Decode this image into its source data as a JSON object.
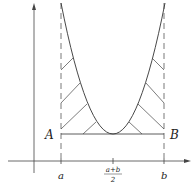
{
  "diagram": {
    "type": "parabola-hatched-region",
    "colors": {
      "stroke": "#333333",
      "axis": "#444444",
      "background": "#ffffff"
    },
    "points": {
      "A": "A",
      "B": "B"
    },
    "x_ticks": {
      "a": "a",
      "mid_num": "a+b",
      "mid_den": "2",
      "b": "b"
    }
  }
}
